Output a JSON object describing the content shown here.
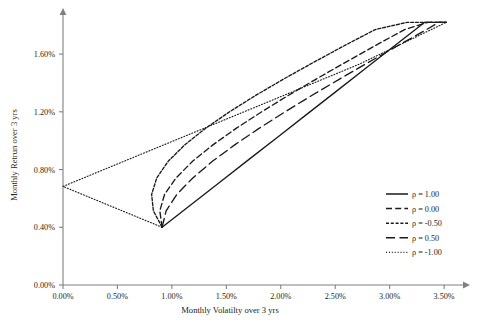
{
  "chart_data": {
    "type": "line",
    "title": "",
    "xlabel": "Monthly Volatilty over 3 yrs",
    "ylabel": "Monthly Retrun over 3 yrs",
    "xlim": [
      0,
      0.036
    ],
    "ylim": [
      0,
      0.0185
    ],
    "xticks": [
      0,
      0.005,
      0.01,
      0.015,
      0.02,
      0.025,
      0.03,
      0.035
    ],
    "xtick_labels": [
      "0.00%",
      "0.50%",
      "1.00%",
      "1.50%",
      "2.00%",
      "2.50%",
      "3.00%",
      "3.50%"
    ],
    "yticks": [
      0,
      0.004,
      0.008,
      0.012,
      0.016
    ],
    "ytick_labels": [
      "0.00%",
      "0.40%",
      "0.80%",
      "1.20%",
      "1.60%"
    ],
    "grid": false,
    "legend_position": "right",
    "asset_a": {
      "vol": 0.0091,
      "ret": 0.004
    },
    "asset_b": {
      "vol": 0.0352,
      "ret": 0.0182
    },
    "series": [
      {
        "name": "ρ = 1.00",
        "rho": 1.0,
        "style": "solid",
        "points": [
          [
            0.0091,
            0.004
          ],
          [
            0.01178,
            0.00558
          ],
          [
            0.01446,
            0.00716
          ],
          [
            0.01714,
            0.00874
          ],
          [
            0.01982,
            0.01031
          ],
          [
            0.0225,
            0.01189
          ],
          [
            0.02518,
            0.01347
          ],
          [
            0.02786,
            0.01505
          ],
          [
            0.03054,
            0.01663
          ],
          [
            0.03322,
            0.0182
          ],
          [
            0.0352,
            0.0182
          ]
        ]
      },
      {
        "name": "ρ = 0.00",
        "rho": 0.0,
        "style": "dashed",
        "points": [
          [
            0.0091,
            0.004
          ],
          [
            0.00889,
            0.00514
          ],
          [
            0.00933,
            0.00628
          ],
          [
            0.01038,
            0.00742
          ],
          [
            0.0119,
            0.00857
          ],
          [
            0.01377,
            0.00971
          ],
          [
            0.0159,
            0.01085
          ],
          [
            0.01822,
            0.01199
          ],
          [
            0.02068,
            0.01313
          ],
          [
            0.02325,
            0.01427
          ],
          [
            0.0259,
            0.01541
          ],
          [
            0.02861,
            0.01656
          ],
          [
            0.03137,
            0.0177
          ],
          [
            0.03352,
            0.0182
          ],
          [
            0.0352,
            0.0182
          ]
        ]
      },
      {
        "name": "ρ = -0.50",
        "rho": -0.5,
        "style": "dense-dashed",
        "points": [
          [
            0.0091,
            0.004
          ],
          [
            0.0083,
            0.00514
          ],
          [
            0.00814,
            0.00628
          ],
          [
            0.00861,
            0.00742
          ],
          [
            0.00966,
            0.00857
          ],
          [
            0.01118,
            0.00971
          ],
          [
            0.01308,
            0.01085
          ],
          [
            0.01527,
            0.01199
          ],
          [
            0.01768,
            0.01313
          ],
          [
            0.02026,
            0.01427
          ],
          [
            0.02297,
            0.01541
          ],
          [
            0.02578,
            0.01656
          ],
          [
            0.02867,
            0.0177
          ],
          [
            0.0316,
            0.0182
          ],
          [
            0.0352,
            0.0182
          ]
        ]
      },
      {
        "name": "ρ = 0.50",
        "rho": 0.5,
        "style": "long-dashed",
        "points": [
          [
            0.0091,
            0.004
          ],
          [
            0.00947,
            0.00514
          ],
          [
            0.01046,
            0.00628
          ],
          [
            0.01192,
            0.00742
          ],
          [
            0.01372,
            0.00857
          ],
          [
            0.01577,
            0.00971
          ],
          [
            0.018,
            0.01085
          ],
          [
            0.02037,
            0.01199
          ],
          [
            0.02284,
            0.01313
          ],
          [
            0.0254,
            0.01427
          ],
          [
            0.02802,
            0.01541
          ],
          [
            0.03069,
            0.01656
          ],
          [
            0.0334,
            0.0177
          ],
          [
            0.0345,
            0.0182
          ],
          [
            0.0352,
            0.0182
          ]
        ]
      },
      {
        "name": "ρ = -1.00",
        "rho": -1.0,
        "style": "dotted",
        "points": [
          [
            0.0091,
            0.004
          ],
          [
            0.0,
            0.00683
          ],
          [
            0.0091,
            0.00966
          ],
          [
            0.0182,
            0.01249
          ],
          [
            0.0273,
            0.01533
          ],
          [
            0.0352,
            0.0182
          ]
        ]
      }
    ]
  },
  "legend": {
    "items": [
      {
        "label": "ρ = 1.00",
        "style": "solid"
      },
      {
        "label": "ρ = 0.00",
        "style": "dashed"
      },
      {
        "label": "ρ = -0.50",
        "style": "dense-dashed"
      },
      {
        "label": "ρ = 0.50",
        "style": "long-dashed"
      },
      {
        "label": "ρ = -1.00",
        "style": "dotted"
      }
    ]
  },
  "colors": {
    "line": "#1a1a1a",
    "axis": "#808080",
    "text": "#231f20",
    "background": "#ffffff"
  }
}
